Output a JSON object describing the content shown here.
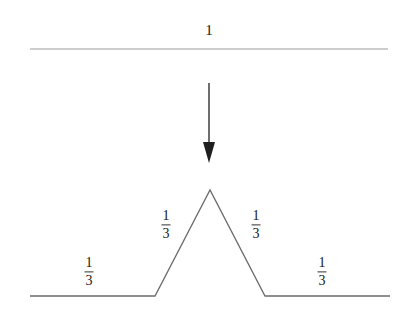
{
  "figure": {
    "background_color": "#ffffff",
    "initiator": {
      "label": "1",
      "line_color": "#bdbdbd",
      "y": 49,
      "x_start": 30,
      "x_end": 388,
      "label_x": 209,
      "label_y": 30
    },
    "arrow": {
      "color": "#4a4a4a",
      "x": 209,
      "y_start": 83,
      "y_end": 163,
      "head_width": 12,
      "head_height": 21
    },
    "generator": {
      "line_color": "#6b6b6b",
      "baseline_y": 296,
      "peak_x": 210,
      "peak_y": 190,
      "points": [
        {
          "x": 30,
          "y": 296
        },
        {
          "x": 155,
          "y": 296
        },
        {
          "x": 210,
          "y": 190
        },
        {
          "x": 265,
          "y": 296
        },
        {
          "x": 390,
          "y": 296
        }
      ],
      "segment_labels": [
        {
          "numerator": "1",
          "denominator": "3",
          "x": 89,
          "y": 272,
          "segment": "left-base"
        },
        {
          "numerator": "1",
          "denominator": "3",
          "x": 166,
          "y": 225,
          "segment": "left-slope"
        },
        {
          "numerator": "1",
          "denominator": "3",
          "x": 256,
          "y": 225,
          "segment": "right-slope"
        },
        {
          "numerator": "1",
          "denominator": "3",
          "x": 322,
          "y": 272,
          "segment": "right-base"
        }
      ]
    }
  }
}
